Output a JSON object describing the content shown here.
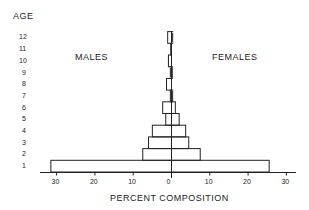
{
  "chart_data": {
    "type": "bar",
    "subtype": "population-pyramid",
    "title": "",
    "ylabel": "AGE",
    "xlabel": "PERCENT COMPOSITION",
    "left_series_label": "MALES",
    "right_series_label": "FEMALES",
    "categories": [
      "1",
      "2",
      "3",
      "4",
      "5",
      "6",
      "7",
      "8",
      "9",
      "10",
      "11",
      "12"
    ],
    "series": [
      {
        "name": "MALES",
        "side": "left",
        "values": [
          31.5,
          7.5,
          6.0,
          5.0,
          1.5,
          2.3,
          0.3,
          1.3,
          0.3,
          0.8,
          0.2,
          1.0
        ]
      },
      {
        "name": "FEMALES",
        "side": "right",
        "values": [
          25.5,
          7.5,
          4.5,
          3.7,
          2.0,
          1.0,
          0.3,
          0.0,
          0.2,
          0.0,
          0.1,
          0.3
        ]
      }
    ],
    "x_ticks": {
      "left": [
        "30",
        "20",
        "10"
      ],
      "center": "0",
      "right": [
        "10",
        "20",
        "30"
      ]
    },
    "xlim": [
      -32,
      32
    ],
    "grid": false,
    "legend": "inline labels (MALES left, FEMALES right)"
  },
  "labels": {
    "age_axis": "AGE",
    "males": "MALES",
    "females": "FEMALES",
    "x_axis": "PERCENT COMPOSITION",
    "age_ticks": [
      "12",
      "11",
      "10",
      "9",
      "8",
      "7",
      "6",
      "5",
      "4",
      "3",
      "2",
      "1"
    ],
    "x_tick_labels": [
      "30",
      "20",
      "10",
      "0",
      "10",
      "20",
      "30"
    ]
  }
}
